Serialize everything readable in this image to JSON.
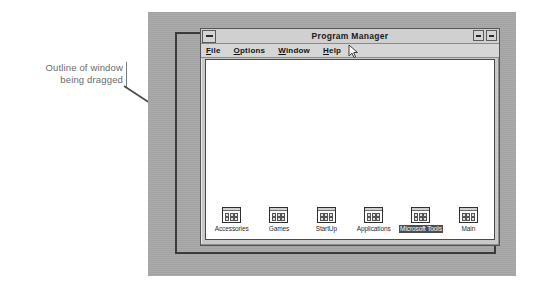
{
  "annotation": {
    "line1": "Outline of window",
    "line2": "being dragged"
  },
  "window": {
    "title": "Program Manager",
    "system_menu_icon": "minimize-dash-icon",
    "buttons": [
      {
        "name": "minimize-button",
        "glyph": "dash"
      },
      {
        "name": "maximize-button",
        "glyph": "dash"
      }
    ],
    "menu": [
      {
        "name": "menu-file",
        "pre": "",
        "acc": "F",
        "post": "ile"
      },
      {
        "name": "menu-options",
        "pre": "",
        "acc": "O",
        "post": "ptions"
      },
      {
        "name": "menu-window",
        "pre": "",
        "acc": "W",
        "post": "indow"
      },
      {
        "name": "menu-help",
        "pre": "",
        "acc": "H",
        "post": "elp"
      }
    ],
    "groups": [
      {
        "label": "Accessories",
        "selected": false
      },
      {
        "label": "Games",
        "selected": false
      },
      {
        "label": "StartUp",
        "selected": false
      },
      {
        "label": "Applications",
        "selected": false
      },
      {
        "label": "Microsoft Tools",
        "selected": true
      },
      {
        "label": "Main",
        "selected": false
      }
    ]
  },
  "colors": {
    "desktop": "#a8a8a8",
    "window_face": "#c9c9c9",
    "client": "#ffffff",
    "outline": "#3a3a3a",
    "selection": "#4d4d4d",
    "annotation_text": "#6b6b6b"
  }
}
